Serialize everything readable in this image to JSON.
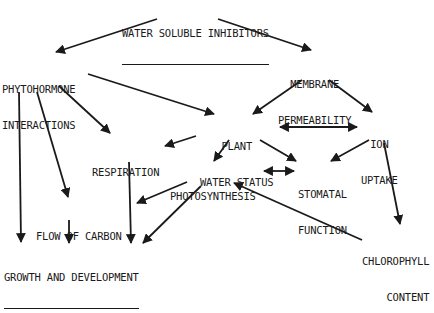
{
  "diagram": {
    "nodes": {
      "water_soluble_inhibitors": [
        "WATER SOLUBLE INHIBITORS"
      ],
      "phytohormone_interactions": [
        "PHYTOHORMONE",
        "INTERACTIONS"
      ],
      "membrane_permeability": [
        "MEMBRANE",
        "PERMEABILITY"
      ],
      "plant_water_status": [
        "PLANT",
        "WATER STATUS"
      ],
      "ion_uptake": [
        "ION",
        "UPTAKE"
      ],
      "respiration": [
        "RESPIRATION"
      ],
      "photosynthesis": [
        "PHOTOSYNTHESIS"
      ],
      "stomatal_function": [
        "STOMATAL",
        "FUNCTION"
      ],
      "flow_of_carbon": [
        "FLOW OF CARBON"
      ],
      "chlorophyll_content": [
        "CHLOROPHYLL",
        "CONTENT"
      ],
      "growth_and_development": [
        "GROWTH AND DEVELOPMENT"
      ]
    },
    "edges": [
      {
        "from": "water_soluble_inhibitors",
        "to": "phytohormone_interactions",
        "bidirectional": false
      },
      {
        "from": "water_soluble_inhibitors",
        "to": "membrane_permeability",
        "bidirectional": false
      },
      {
        "from": "phytohormone_interactions",
        "to": "plant_water_status",
        "bidirectional": false
      },
      {
        "from": "phytohormone_interactions",
        "to": "respiration",
        "bidirectional": false
      },
      {
        "from": "phytohormone_interactions",
        "to": "flow_of_carbon",
        "bidirectional": false
      },
      {
        "from": "phytohormone_interactions",
        "to": "growth_and_development",
        "bidirectional": false
      },
      {
        "from": "membrane_permeability",
        "to": "plant_water_status",
        "bidirectional": false
      },
      {
        "from": "membrane_permeability",
        "to": "ion_uptake",
        "bidirectional": false
      },
      {
        "from": "plant_water_status",
        "to": "ion_uptake",
        "bidirectional": true
      },
      {
        "from": "plant_water_status",
        "to": "respiration",
        "bidirectional": false
      },
      {
        "from": "plant_water_status",
        "to": "photosynthesis",
        "bidirectional": false
      },
      {
        "from": "plant_water_status",
        "to": "stomatal_function",
        "bidirectional": false
      },
      {
        "from": "ion_uptake",
        "to": "stomatal_function",
        "bidirectional": false
      },
      {
        "from": "ion_uptake",
        "to": "chlorophyll_content",
        "bidirectional": false
      },
      {
        "from": "photosynthesis",
        "to": "stomatal_function",
        "bidirectional": true
      },
      {
        "from": "photosynthesis",
        "to": "flow_of_carbon",
        "bidirectional": false
      },
      {
        "from": "photosynthesis",
        "to": "growth_and_development",
        "bidirectional": false
      },
      {
        "from": "chlorophyll_content",
        "to": "photosynthesis",
        "bidirectional": false
      },
      {
        "from": "respiration",
        "to": "growth_and_development",
        "bidirectional": false
      },
      {
        "from": "flow_of_carbon",
        "to": "growth_and_development",
        "bidirectional": false
      }
    ]
  }
}
